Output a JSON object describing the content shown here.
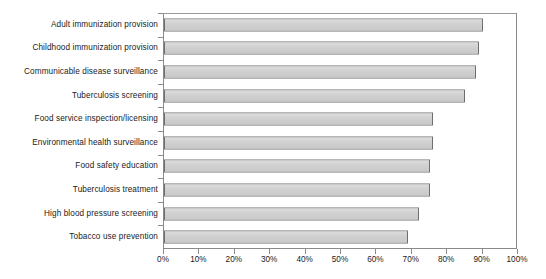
{
  "chart_data": {
    "type": "bar",
    "orientation": "horizontal",
    "title": "",
    "xlabel": "",
    "ylabel": "",
    "xlim": [
      0,
      100
    ],
    "xtick_step": 10,
    "xtick_suffix": "%",
    "grid": false,
    "legend": false,
    "bar_fill_color": "#d2d2d2",
    "bar_border_color": "#6e6e6e",
    "axis_color": "#8a8a8a",
    "text_color": "#1a1a1a",
    "categories": [
      "Adult immunization provision",
      "Childhood immunization provision",
      "Communicable disease surveillance",
      "Tuberculosis screening",
      "Food service inspection/licensing",
      "Environmental health surveillance",
      "Food safety education",
      "Tuberculosis treatment",
      "High blood pressure screening",
      "Tobacco use prevention"
    ],
    "values": [
      90,
      89,
      88,
      85,
      76,
      76,
      75,
      75,
      72,
      69
    ],
    "tick_labels": [
      "0%",
      "10%",
      "20%",
      "30%",
      "40%",
      "50%",
      "60%",
      "70%",
      "80%",
      "90%",
      "100%"
    ],
    "tick_values": [
      0,
      10,
      20,
      30,
      40,
      50,
      60,
      70,
      80,
      90,
      100
    ]
  }
}
